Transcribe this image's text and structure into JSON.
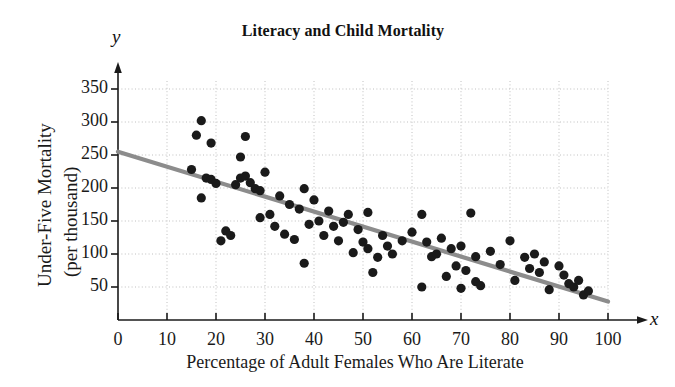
{
  "chart_data": {
    "type": "scatter",
    "title": "Literacy and Child Mortality",
    "xlabel": "Percentage of Adult Females Who Are Literate",
    "ylabel": "Under-Five Mortality (per thousand)",
    "ylabel_line1": "Under-Five Mortality",
    "ylabel_line2": "(per thousand)",
    "x_axis_letter": "x",
    "y_axis_letter": "y",
    "xlim": [
      0,
      100
    ],
    "ylim": [
      0,
      365
    ],
    "xticks": [
      0,
      10,
      20,
      30,
      40,
      50,
      60,
      70,
      80,
      90,
      100
    ],
    "yticks": [
      50,
      100,
      150,
      200,
      250,
      300,
      350
    ],
    "grid": true,
    "grid_style": "dotted",
    "legend": null,
    "marker_color": "#1a1a1a",
    "trendline": {
      "label": "least-squares regression line",
      "color": "#8c8c8c",
      "x": [
        0,
        100
      ],
      "y": [
        255,
        28
      ]
    },
    "points": [
      [
        15,
        228
      ],
      [
        16,
        280
      ],
      [
        17,
        302
      ],
      [
        19,
        268
      ],
      [
        17,
        185
      ],
      [
        18,
        215
      ],
      [
        19,
        213
      ],
      [
        20,
        207
      ],
      [
        21,
        120
      ],
      [
        22,
        135
      ],
      [
        23,
        128
      ],
      [
        24,
        205
      ],
      [
        25,
        247
      ],
      [
        25,
        215
      ],
      [
        26,
        278
      ],
      [
        26,
        218
      ],
      [
        27,
        208
      ],
      [
        28,
        199
      ],
      [
        29,
        196
      ],
      [
        29,
        155
      ],
      [
        30,
        224
      ],
      [
        31,
        160
      ],
      [
        32,
        142
      ],
      [
        33,
        188
      ],
      [
        34,
        130
      ],
      [
        35,
        175
      ],
      [
        36,
        122
      ],
      [
        37,
        168
      ],
      [
        38,
        199
      ],
      [
        38,
        86
      ],
      [
        39,
        145
      ],
      [
        40,
        182
      ],
      [
        41,
        150
      ],
      [
        42,
        128
      ],
      [
        43,
        165
      ],
      [
        44,
        142
      ],
      [
        45,
        120
      ],
      [
        46,
        148
      ],
      [
        47,
        160
      ],
      [
        48,
        102
      ],
      [
        49,
        137
      ],
      [
        50,
        118
      ],
      [
        51,
        163
      ],
      [
        51,
        108
      ],
      [
        52,
        72
      ],
      [
        53,
        95
      ],
      [
        54,
        128
      ],
      [
        55,
        112
      ],
      [
        56,
        100
      ],
      [
        58,
        120
      ],
      [
        60,
        133
      ],
      [
        62,
        160
      ],
      [
        62,
        50
      ],
      [
        63,
        118
      ],
      [
        64,
        96
      ],
      [
        65,
        100
      ],
      [
        66,
        124
      ],
      [
        67,
        66
      ],
      [
        68,
        108
      ],
      [
        69,
        82
      ],
      [
        70,
        112
      ],
      [
        70,
        48
      ],
      [
        71,
        75
      ],
      [
        72,
        162
      ],
      [
        73,
        58
      ],
      [
        73,
        96
      ],
      [
        74,
        52
      ],
      [
        76,
        104
      ],
      [
        78,
        84
      ],
      [
        80,
        120
      ],
      [
        81,
        60
      ],
      [
        83,
        95
      ],
      [
        84,
        78
      ],
      [
        85,
        100
      ],
      [
        86,
        72
      ],
      [
        87,
        88
      ],
      [
        88,
        46
      ],
      [
        90,
        82
      ],
      [
        91,
        68
      ],
      [
        92,
        55
      ],
      [
        93,
        50
      ],
      [
        94,
        60
      ],
      [
        95,
        38
      ],
      [
        96,
        44
      ]
    ]
  }
}
